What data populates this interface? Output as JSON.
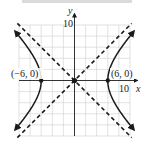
{
  "chart_data": {
    "type": "line",
    "title": "",
    "xlabel": "x",
    "ylabel": "y",
    "xlim": [
      -10,
      10
    ],
    "ylim": [
      -10,
      10
    ],
    "grid": true,
    "grid_step": 2,
    "x_tick_labels": [
      "10"
    ],
    "y_tick_labels": [
      "10"
    ],
    "series": [
      {
        "name": "hyperbola",
        "style": "solid",
        "equation": "x^2/36 - y^2/36 = 1",
        "branches": [
          "left",
          "right"
        ]
      },
      {
        "name": "asymptote-1",
        "style": "dashed",
        "equation": "y = x"
      },
      {
        "name": "asymptote-2",
        "style": "dashed",
        "equation": "y = -x"
      }
    ],
    "points": [
      {
        "label": "(−6, 0)",
        "x": -6,
        "y": 0
      },
      {
        "label": "(6, 0)",
        "x": 6,
        "y": 0
      },
      {
        "label": "",
        "x": 0,
        "y": 0
      }
    ],
    "colors": {
      "curve": "#1a1a1a",
      "grid": "#c8c8c8",
      "axis": "#333333"
    }
  },
  "labels": {
    "x_axis": "x",
    "y_axis": "y",
    "x_tick": "10",
    "y_tick": "10",
    "left_vertex": "(−6, 0)",
    "right_vertex": "(6, 0)"
  }
}
